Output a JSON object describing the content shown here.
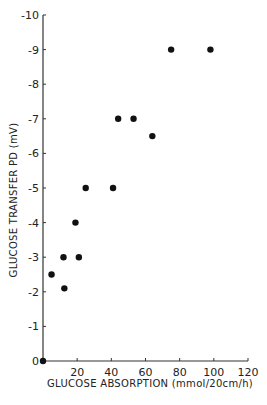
{
  "chart_data": {
    "type": "scatter",
    "title": "",
    "xlabel": "GLUCOSE ABSORPTION (mmol/20cm/h)",
    "ylabel": "GLUCOSE TRANSFER PD (mV)",
    "xlim": [
      0,
      120
    ],
    "ylim": [
      0,
      -10
    ],
    "xticks": [
      20,
      40,
      60,
      80,
      100,
      120
    ],
    "yticks": [
      0,
      -1,
      -2,
      -3,
      -4,
      -5,
      -6,
      -7,
      -8,
      -9,
      -10
    ],
    "ytick_labels": [
      "0",
      "-1",
      "-2",
      "-3",
      "-4",
      "-5",
      "-6",
      "-7",
      "-8",
      "-9",
      "-10"
    ],
    "grid": false,
    "legend": null,
    "series": [
      {
        "name": "data",
        "points": [
          {
            "x": 0,
            "y": 0
          },
          {
            "x": 5,
            "y": -2.5
          },
          {
            "x": 12,
            "y": -3.0
          },
          {
            "x": 12.5,
            "y": -2.1
          },
          {
            "x": 19,
            "y": -4.0
          },
          {
            "x": 21,
            "y": -3.0
          },
          {
            "x": 25,
            "y": -5.0
          },
          {
            "x": 41,
            "y": -5.0
          },
          {
            "x": 44,
            "y": -7.0
          },
          {
            "x": 53,
            "y": -7.0
          },
          {
            "x": 64,
            "y": -6.5
          },
          {
            "x": 75,
            "y": -9.0
          },
          {
            "x": 98,
            "y": -9.0
          }
        ]
      }
    ]
  }
}
